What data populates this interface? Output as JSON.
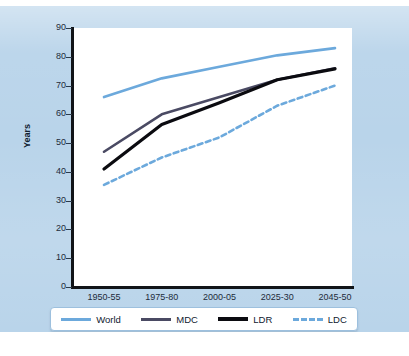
{
  "chart_data": {
    "type": "line",
    "title": "",
    "xlabel": "",
    "ylabel": "Years",
    "categories": [
      "1950-55",
      "1975-80",
      "2000-05",
      "2025-30",
      "2045-50"
    ],
    "ylim": [
      0,
      90
    ],
    "ytick_values": [
      0,
      10,
      20,
      30,
      40,
      50,
      60,
      70,
      80,
      90
    ],
    "ytick_labels": [
      "0",
      "10",
      "20",
      "30",
      "40",
      "50",
      "60",
      "70",
      "80",
      "90"
    ],
    "grid": false,
    "legend_position": "bottom",
    "series": [
      {
        "name": "World",
        "color": "#6ca9dc",
        "style": "solid",
        "values": [
          66.0,
          72.5,
          76.5,
          80.5,
          83.0
        ]
      },
      {
        "name": "MDC",
        "color": "#4a4a63",
        "style": "solid",
        "values": [
          47.0,
          60.0,
          66.0,
          72.0,
          76.0
        ]
      },
      {
        "name": "LDR",
        "color": "#0b0b10",
        "style": "solid",
        "values": [
          41.0,
          56.5,
          64.0,
          72.0,
          75.8
        ]
      },
      {
        "name": "LDC",
        "color": "#6ca9dc",
        "style": "dashed",
        "values": [
          35.5,
          45.0,
          52.0,
          63.0,
          70.0
        ]
      }
    ]
  },
  "legend": {
    "items": [
      {
        "label": "World"
      },
      {
        "label": "MDC"
      },
      {
        "label": "LDR"
      },
      {
        "label": "LDC"
      }
    ]
  },
  "colors": {
    "panel_background": "#b9d4ea",
    "plot_background": "#ffffff",
    "axis": "#111418",
    "world": "#6ca9dc",
    "mdc": "#4a4a63",
    "ldr": "#0b0b10",
    "ldc": "#6ca9dc",
    "tick_text": "#1d2b3a"
  }
}
